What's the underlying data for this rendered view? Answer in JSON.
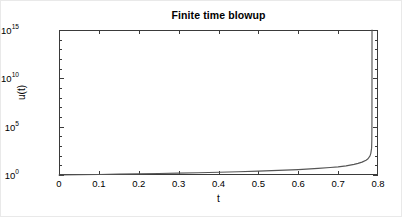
{
  "figure": {
    "title": "Finite time blowup",
    "background_color": "#ffffff",
    "axis_color": "#3a3a3a",
    "curve_color": "#555555"
  },
  "axes": {
    "xlabel": "t",
    "ylabel": "u(t)",
    "x_ticks": [
      "0",
      "0.1",
      "0.2",
      "0.3",
      "0.4",
      "0.5",
      "0.6",
      "0.7",
      "0.8"
    ],
    "y_tick_mantissa": "10",
    "y_tick_exponents": [
      "15",
      "10",
      "5",
      "0"
    ]
  },
  "chart_data": {
    "type": "line",
    "title": "Finite time blowup",
    "xlabel": "t",
    "ylabel": "u(t)",
    "xlim": [
      0,
      0.8
    ],
    "ylim": [
      1,
      1000000000000000
    ],
    "yscale": "log",
    "xscale": "linear",
    "grid": false,
    "legend": null,
    "xticks": [
      0,
      0.1,
      0.2,
      0.3,
      0.4,
      0.5,
      0.6,
      0.7,
      0.8
    ],
    "xticklabels": [
      "0",
      "0.1",
      "0.2",
      "0.3",
      "0.4",
      "0.5",
      "0.6",
      "0.7",
      "0.8"
    ],
    "yticks": [
      1,
      100000,
      10000000000,
      1000000000000000
    ],
    "yticklabels": [
      "10^0",
      "10^5",
      "10^10",
      "10^15"
    ],
    "blowup_time": 0.785,
    "series": [
      {
        "name": "u(t)",
        "color": "#555555",
        "x": [
          0,
          0.05,
          0.1,
          0.15,
          0.2,
          0.25,
          0.3,
          0.35,
          0.4,
          0.45,
          0.5,
          0.55,
          0.6,
          0.65,
          0.68,
          0.7,
          0.72,
          0.74,
          0.75,
          0.76,
          0.77,
          0.775,
          0.78,
          0.782,
          0.784,
          0.7845,
          0.7848,
          0.78495,
          0.785
        ],
        "y": [
          1.0,
          1.07,
          1.14,
          1.22,
          1.32,
          1.43,
          1.56,
          1.72,
          1.92,
          2.17,
          2.5,
          2.96,
          3.64,
          4.8,
          5.9,
          7.0,
          8.9,
          12.5,
          15.8,
          21.5,
          34.0,
          48.0,
          95.0,
          175.0,
          600.0,
          3500.0,
          150000.0,
          50000000000.0,
          1000000000000000.0
        ]
      }
    ]
  }
}
